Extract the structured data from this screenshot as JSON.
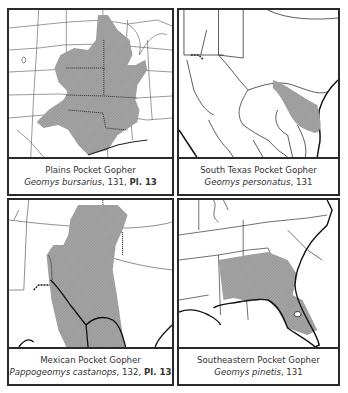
{
  "figure": {
    "layout": "2x2 grid of range maps",
    "range_fill_color": "#9a9a9a",
    "border_color": "#2a2a2a"
  },
  "panels": [
    {
      "common_name": "Plains Pocket Gopher",
      "genus_species": "Geomys bursarius",
      "page": ", 131, ",
      "plate": "Pl. 13",
      "region": "Central United States (Great Plains)"
    },
    {
      "common_name": "South Texas Pocket Gopher",
      "genus_species": "Geomys personatus",
      "page": ", 131",
      "plate": "",
      "region": "Southern Texas coast"
    },
    {
      "common_name": "Mexican Pocket Gopher",
      "genus_species": "Pappogeomys castanops",
      "page": ", 132, ",
      "plate": "Pl. 13",
      "region": "Southwest US / Texas panhandle to Mexico"
    },
    {
      "common_name": "Southeastern Pocket Gopher",
      "genus_species": "Geomys pinetis",
      "page": ", 131",
      "plate": "",
      "region": "Alabama, Georgia, Florida"
    }
  ]
}
